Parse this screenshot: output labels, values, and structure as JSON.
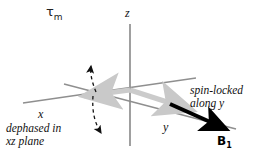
{
  "figure": {
    "type": "vector-diagram",
    "title_label": "τ",
    "title_sub": "m",
    "background": "#ffffff",
    "axes": {
      "z": {
        "label": "z",
        "color": "#8c8c8c",
        "orientation": "vertical"
      },
      "x": {
        "label": "x",
        "color": "#8c8c8c",
        "orientation": "diagonal-upper-right-to-lower-left"
      },
      "y": {
        "label": "y",
        "color": "#8c8c8c",
        "orientation": "diagonal-upper-left-to-lower-right"
      }
    },
    "vectors": [
      {
        "name": "magnetization-minus-x",
        "color": "#c9c9c9",
        "direction": "along -x",
        "style": "thick-gray-arrow"
      },
      {
        "name": "magnetization-plus-y",
        "color": "#c9c9c9",
        "direction": "along +y",
        "style": "thick-gray-arrow"
      },
      {
        "name": "b1-field",
        "color": "#000000",
        "direction": "along +y",
        "style": "thick-black-arrow",
        "label": "B",
        "label_sub": "1"
      }
    ],
    "dephasing": {
      "name": "dephasing-arc",
      "style": "dashed",
      "color": "#1a1a1a",
      "arrowheads": 2,
      "description": "dashed arc with arrowheads at both ends in the xz plane"
    },
    "annotations": {
      "dephased": {
        "line1": "dephased in",
        "line2": "xz plane"
      },
      "spinlocked": {
        "line1": "spin-locked",
        "line2": "along y"
      }
    }
  }
}
